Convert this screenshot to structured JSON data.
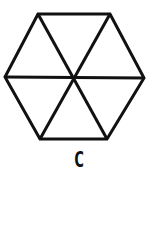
{
  "figure": {
    "shape": "regular hexagon divided into 6 triangles",
    "stroke_color": "#111111",
    "vertices": [
      [
        38,
        14
      ],
      [
        110,
        14
      ],
      [
        144,
        78
      ],
      [
        107,
        139
      ],
      [
        40,
        139
      ],
      [
        5,
        77
      ]
    ],
    "center": [
      73,
      77
    ],
    "label": "C"
  }
}
